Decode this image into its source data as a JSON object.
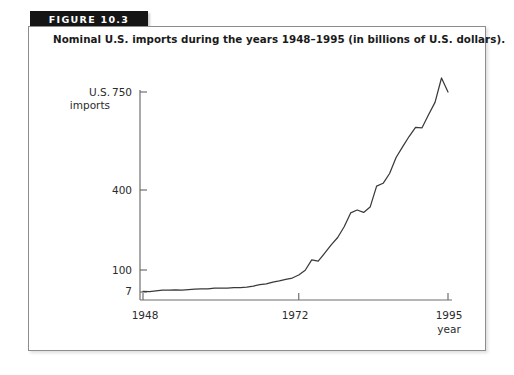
{
  "figure": {
    "banner_label": "FIGURE 10.3",
    "caption": "Nominal U.S. imports during the years 1948–1995 (in billions of U.S. dollars).",
    "banner_color": "#151515",
    "banner_text_color": "#ffffff",
    "panel_border_color": "#8d8d8d",
    "line_color": "#3a3a3a",
    "axis_color": "#6f6f6f"
  },
  "chart_data": {
    "type": "line",
    "title": "Nominal U.S. imports during the years 1948–1995 (in billions of U.S. dollars).",
    "xlabel": "year",
    "ylabel": "U.S. imports",
    "ylabel_lines": [
      "U.S.",
      "imports"
    ],
    "xlim": [
      1948,
      1995
    ],
    "ylim": [
      7,
      750
    ],
    "grid": false,
    "legend": null,
    "xticks": [
      1948,
      1972,
      1995
    ],
    "xticklabels": [
      "1948",
      "1972",
      "1995"
    ],
    "yticks": [
      7,
      100,
      400,
      750
    ],
    "yticklabels": [
      "7",
      "100",
      "400",
      "750"
    ],
    "series": [
      {
        "name": "U.S. imports",
        "x": [
          1948,
          1949,
          1950,
          1951,
          1952,
          1953,
          1954,
          1955,
          1956,
          1957,
          1958,
          1959,
          1960,
          1961,
          1962,
          1963,
          1964,
          1965,
          1966,
          1967,
          1968,
          1969,
          1970,
          1971,
          1972,
          1973,
          1974,
          1975,
          1976,
          1977,
          1978,
          1979,
          1980,
          1981,
          1982,
          1983,
          1984,
          1985,
          1986,
          1987,
          1988,
          1989,
          1990,
          1991,
          1992,
          1993,
          1994,
          1995
        ],
        "values": [
          10,
          9,
          12,
          15,
          15,
          16,
          15,
          17,
          19,
          20,
          20,
          23,
          23,
          23,
          25,
          26,
          28,
          32,
          38,
          41,
          49,
          54,
          60,
          66,
          79,
          99,
          138,
          133,
          163,
          194,
          222,
          262,
          314,
          325,
          316,
          336,
          414,
          424,
          459,
          516,
          554,
          591,
          624,
          622,
          669,
          713,
          800,
          750
        ]
      }
    ]
  }
}
